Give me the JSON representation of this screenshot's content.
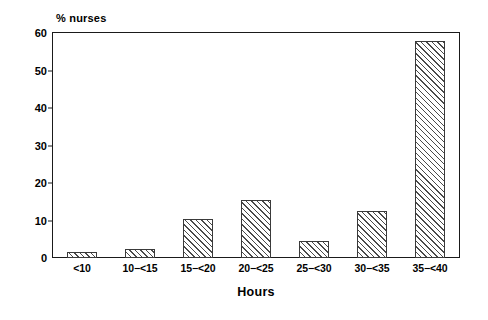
{
  "chart_data": {
    "type": "bar",
    "title": "",
    "xlabel": "Hours",
    "ylabel": "% nurses",
    "categories": [
      "<10",
      "10−<15",
      "15−<20",
      "20−<25",
      "25−<30",
      "30−<35",
      "35−<40"
    ],
    "values": [
      1.5,
      2.5,
      10.5,
      15.5,
      4.5,
      12.5,
      58
    ],
    "ylim": [
      0,
      60
    ],
    "yticks": [
      0,
      10,
      20,
      30,
      40,
      50,
      60
    ],
    "ytick_labels": [
      "0",
      "10",
      "20",
      "30",
      "40",
      "50",
      "60"
    ],
    "grid": false,
    "legend": null,
    "bar_fill": "#ffffff",
    "bar_hatch": "diagonal-forward",
    "bar_edge_color": "#3a3a3a",
    "axis_color": "#1a1a1a"
  }
}
